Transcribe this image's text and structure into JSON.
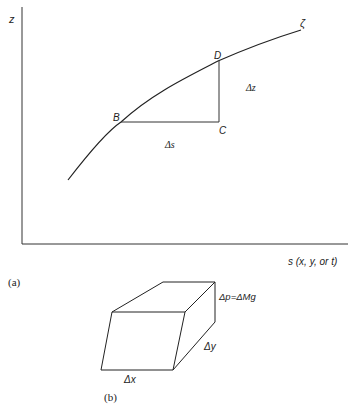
{
  "figure_a": {
    "panel_label": "(a)",
    "y_axis_label": "z",
    "x_axis_label": "s (x, y, or t)",
    "curve_label": "ζ",
    "points": {
      "B": "B",
      "C": "C",
      "D": "D"
    },
    "delta_s_label": "Δs",
    "delta_z_label": "Δz"
  },
  "figure_b": {
    "panel_label": "(b)",
    "delta_x_label": "Δx",
    "delta_y_label": "Δy",
    "pressure_label": "Δp=ΔMg"
  },
  "colors": {
    "line": "#222222",
    "background": "#ffffff"
  }
}
